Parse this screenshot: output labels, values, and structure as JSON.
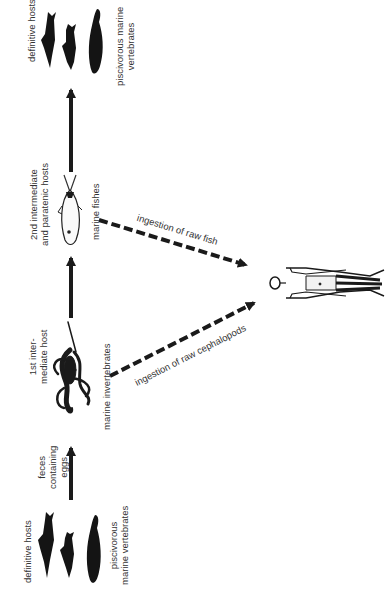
{
  "diagram": {
    "type": "life-cycle",
    "orientation": "rotated-90-ccw",
    "nodes": {
      "definitive_top": {
        "label": "definitive hosts",
        "sublabel_line1": "piscivorous marine",
        "sublabel_line2": "vertebrates",
        "icon": "marine-mammals-icon"
      },
      "second_intermediate": {
        "label_line1": "2nd intermediate",
        "label_line2": "and paratenic hosts",
        "sublabel": "marine fishes",
        "icon": "fish-icon"
      },
      "first_intermediate": {
        "label_line1": "1st inter-",
        "label_line2": "mediate host",
        "sublabel": "marine invertebrates",
        "icon": "squid-icon"
      },
      "feces": {
        "label_line1": "feces",
        "label_line2": "containing",
        "label_line3": "eggs"
      },
      "definitive_bottom": {
        "label": "definitive hosts",
        "sublabel_line1": "piscivorous",
        "sublabel_line2": "marine vertebrates",
        "icon": "marine-mammals-icon"
      },
      "human": {
        "icon": "human-figure-icon"
      }
    },
    "edges": [
      {
        "from": "definitive_bottom",
        "to": "first_intermediate",
        "style": "solid"
      },
      {
        "from": "first_intermediate",
        "to": "second_intermediate",
        "style": "solid"
      },
      {
        "from": "second_intermediate",
        "to": "definitive_top",
        "style": "solid"
      },
      {
        "from": "second_intermediate",
        "to": "human",
        "style": "dashed",
        "label": "ingestion of raw fish"
      },
      {
        "from": "first_intermediate",
        "to": "human",
        "style": "dashed",
        "label": "ingestion of raw cephalopods"
      }
    ],
    "colors": {
      "ink": "#1a1a1a",
      "background": "#ffffff"
    }
  }
}
